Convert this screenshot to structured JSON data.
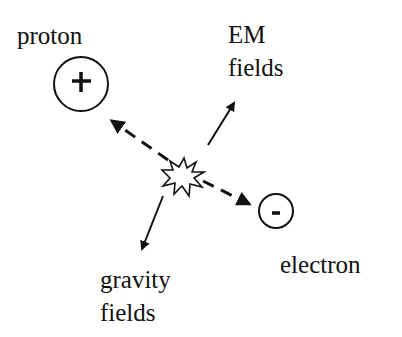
{
  "diagram": {
    "labels": {
      "proton": "proton",
      "em_line1": "EM",
      "em_line2": "fields",
      "electron": "electron",
      "gravity_line1": "gravity",
      "gravity_line2": "fields"
    },
    "symbols": {
      "proton_charge": "+",
      "electron_charge": "-"
    },
    "colors": {
      "ink": "#111111",
      "background": "#ffffff"
    }
  }
}
